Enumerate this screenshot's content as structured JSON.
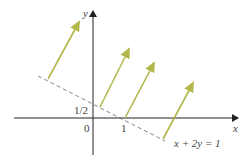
{
  "axes": {
    "x_label": "x",
    "y_label": "y",
    "origin_label": "0",
    "x_tick_label": "1",
    "y_tick_label": "1/2"
  },
  "line": {
    "equation_label": "x + 2y = 1",
    "style": "dashed",
    "color": "#555555"
  },
  "vectors": {
    "color": "#b3b64a",
    "count": 4,
    "description": "parallel vectors with base points on the line x + 2y = 1"
  },
  "colors": {
    "axis": "#222222",
    "text": "#444444",
    "background": "#ffffff"
  }
}
